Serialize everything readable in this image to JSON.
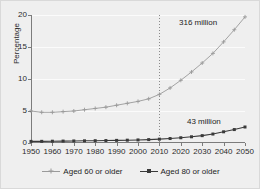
{
  "chart_data": {
    "type": "line",
    "title": "",
    "xlabel": "",
    "ylabel": "Percentage",
    "xlim": [
      1950,
      2050
    ],
    "ylim": [
      0,
      20
    ],
    "grid": true,
    "legend_position": "bottom",
    "x": [
      1950,
      1955,
      1960,
      1965,
      1970,
      1975,
      1980,
      1985,
      1990,
      1995,
      2000,
      2005,
      2010,
      2015,
      2020,
      2025,
      2030,
      2035,
      2040,
      2045,
      2050
    ],
    "series": [
      {
        "name": "Aged 60 or older",
        "color": "#9a9a9a",
        "marker": "plus",
        "values": [
          5.0,
          4.8,
          4.8,
          4.9,
          5.0,
          5.2,
          5.4,
          5.6,
          5.9,
          6.2,
          6.5,
          6.9,
          7.6,
          8.6,
          9.8,
          11.1,
          12.5,
          14.0,
          15.8,
          17.7,
          19.7
        ]
      },
      {
        "name": "Aged 80 or older",
        "color": "#3a3a3a",
        "marker": "square",
        "values": [
          0.25,
          0.26,
          0.28,
          0.3,
          0.32,
          0.34,
          0.36,
          0.38,
          0.41,
          0.44,
          0.48,
          0.53,
          0.6,
          0.7,
          0.82,
          0.97,
          1.15,
          1.4,
          1.75,
          2.1,
          2.5
        ]
      }
    ],
    "reference_line": {
      "name": "year-2010-marker",
      "x": 2010,
      "style": "dotted",
      "color": "#8a8a8a"
    },
    "annotations": [
      {
        "id": "annotation-316",
        "text": "316 million",
        "series": "Aged 60 or older"
      },
      {
        "id": "annotation-43",
        "text": "43 million",
        "series": "Aged 80 or older"
      }
    ],
    "yticks": [
      0,
      5,
      10,
      15,
      20
    ],
    "ytick_labels": [
      "0",
      "5",
      "10",
      "15",
      "20"
    ],
    "xticks": [
      1950,
      1960,
      1970,
      1980,
      1990,
      2000,
      2010,
      2020,
      2030,
      2040,
      2050
    ],
    "xtick_labels": [
      "1950",
      "1960",
      "1970",
      "1980",
      "1990",
      "2000",
      "2010",
      "2020",
      "2030",
      "2040",
      "2050"
    ]
  },
  "legend": {
    "entries": [
      {
        "label": "Aged 60 or older"
      },
      {
        "label": "Aged 80 or older"
      }
    ]
  },
  "axis": {
    "ylabel": "Percentage"
  },
  "annotations": {
    "upper": "316 million",
    "lower": "43 million"
  },
  "colors": {
    "series_60": "#9a9a9a",
    "series_80": "#3a3a3a",
    "background": "#efefef",
    "gridline": "#fbfbfb",
    "axis": "#7c7c7c"
  }
}
